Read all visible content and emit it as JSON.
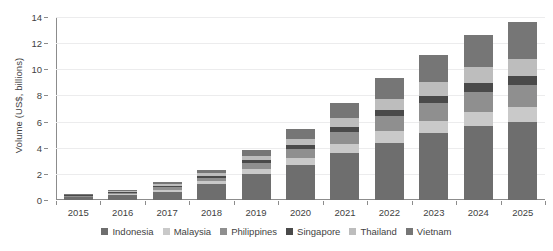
{
  "chart_data": {
    "type": "bar",
    "stacked": true,
    "title": "",
    "xlabel": "",
    "ylabel": "Volume (US$, billions)",
    "categories": [
      "2015",
      "2016",
      "2017",
      "2018",
      "2019",
      "2020",
      "2021",
      "2022",
      "2023",
      "2024",
      "2025"
    ],
    "ylim": [
      0,
      14
    ],
    "yticks": [
      0,
      2,
      4,
      6,
      8,
      10,
      12,
      14
    ],
    "ytick_labels": [
      "0",
      "2",
      "4",
      "6",
      "8",
      "10",
      "12",
      "14"
    ],
    "grid": true,
    "legend_position": "bottom",
    "series": [
      {
        "name": "Indonesia",
        "color": "#6e6e6e",
        "values": [
          0.2,
          0.35,
          0.65,
          1.2,
          2.0,
          2.7,
          3.6,
          4.4,
          5.1,
          5.7,
          6.0
        ]
      },
      {
        "name": "Malaysia",
        "color": "#c9c9c9",
        "values": [
          0.05,
          0.08,
          0.15,
          0.22,
          0.4,
          0.55,
          0.7,
          0.85,
          0.95,
          1.05,
          1.1
        ]
      },
      {
        "name": "Philippines",
        "color": "#8f8f8f",
        "values": [
          0.06,
          0.1,
          0.18,
          0.28,
          0.45,
          0.65,
          0.9,
          1.15,
          1.35,
          1.55,
          1.7
        ]
      },
      {
        "name": "Singapore",
        "color": "#4a4a4a",
        "values": [
          0.04,
          0.06,
          0.09,
          0.14,
          0.22,
          0.32,
          0.42,
          0.5,
          0.58,
          0.65,
          0.7
        ]
      },
      {
        "name": "Thailand",
        "color": "#bdbdbd",
        "values": [
          0.05,
          0.08,
          0.13,
          0.2,
          0.33,
          0.48,
          0.66,
          0.85,
          1.05,
          1.2,
          1.3
        ]
      },
      {
        "name": "Vietnam",
        "color": "#767676",
        "values": [
          0.05,
          0.08,
          0.15,
          0.26,
          0.45,
          0.7,
          1.12,
          1.6,
          2.1,
          2.45,
          2.8
        ]
      }
    ],
    "totals": [
      0.45,
      0.75,
      1.35,
      2.3,
      3.85,
      5.4,
      7.4,
      9.35,
      11.13,
      12.6,
      13.6
    ]
  },
  "legend": {
    "items": [
      {
        "label": "Indonesia"
      },
      {
        "label": "Malaysia"
      },
      {
        "label": "Philippines"
      },
      {
        "label": "Singapore"
      },
      {
        "label": "Thailand"
      },
      {
        "label": "Vietnam"
      }
    ]
  },
  "axes": {
    "y_title": "Volume (US$, billions)"
  }
}
